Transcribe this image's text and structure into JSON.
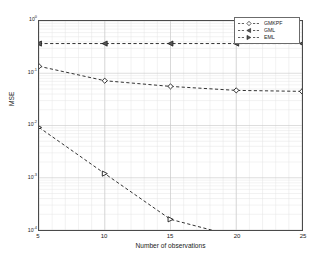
{
  "chart_data": {
    "type": "line",
    "title": "",
    "xlabel": "Number of observations",
    "ylabel": "MSE",
    "x": [
      5,
      10,
      15,
      20,
      25
    ],
    "xtick_labels": [
      "5",
      "10",
      "15",
      "20",
      "25"
    ],
    "xlim": [
      5,
      25
    ],
    "yscale": "log",
    "ylim": [
      0.0001,
      1
    ],
    "ytick_labels": [
      "10",
      "10",
      "10",
      "10",
      "10"
    ],
    "ytick_exponents": [
      "0",
      "-1",
      "-2",
      "-3",
      "-4"
    ],
    "ytick_values": [
      1,
      0.1,
      0.01,
      0.001,
      0.0001
    ],
    "grid": true,
    "minor_grid": true,
    "legend_position": "upper right",
    "series": [
      {
        "name": "GMKPF",
        "marker": "diamond",
        "linestyle": "dashed",
        "color": "#1a1a1a",
        "values": [
          0.136,
          0.072,
          0.056,
          0.047,
          0.045
        ]
      },
      {
        "name": "GML",
        "marker": "triangle-left",
        "linestyle": "dashed",
        "color": "#1a1a1a",
        "values": [
          0.37,
          0.37,
          0.37,
          0.37,
          0.37
        ]
      },
      {
        "name": "EML",
        "marker": "triangle-right",
        "linestyle": "dashed",
        "color": "#1a1a1a",
        "values": [
          0.0092,
          0.0012,
          0.00016,
          7.5e-05,
          5.8e-05
        ]
      }
    ]
  },
  "legend": {
    "entries": [
      {
        "label": "GMKPF"
      },
      {
        "label": "GML"
      },
      {
        "label": "EML"
      }
    ]
  },
  "axes": {
    "x_title": "Number of observations",
    "y_title": "MSE"
  },
  "colors": {
    "background": "#ffffff",
    "frame": "#4a4a4a",
    "grid_major": "#c8c8c8",
    "grid_minor": "#e4e4e4",
    "line": "#1a1a1a",
    "text": "#1a1a1a"
  }
}
